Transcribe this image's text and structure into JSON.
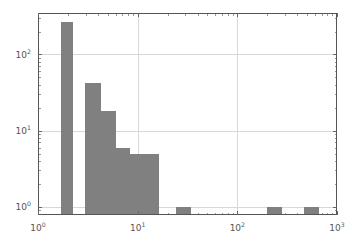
{
  "figure": {
    "background_color": "#ffffff",
    "plot_area": {
      "left": 38,
      "top": 13,
      "right": 337,
      "bottom": 215
    }
  },
  "chart_data": {
    "type": "bar",
    "subtype": "histogram-log-log",
    "title": "",
    "subtitle": "",
    "xlabel": "",
    "ylabel": "",
    "xscale": "log",
    "yscale": "log",
    "xlim": [
      1,
      1000
    ],
    "ylim": [
      0.78,
      350
    ],
    "grid": true,
    "grid_color": "#d8d8d8",
    "legend": null,
    "legend_position": "none",
    "bar_color": "#808080",
    "axis_color": "#555555",
    "x_tick_labels": [
      "10^0",
      "10^1",
      "10^2",
      "10^3"
    ],
    "x_tick_values": [
      1,
      10,
      100,
      1000
    ],
    "x_tick_display": [
      {
        "base": "10",
        "exp": "0"
      },
      {
        "base": "10",
        "exp": "1"
      },
      {
        "base": "10",
        "exp": "2"
      },
      {
        "base": "10",
        "exp": "3"
      }
    ],
    "y_tick_labels": [
      "10^0",
      "10^1",
      "10^2"
    ],
    "y_tick_values": [
      1,
      10,
      100
    ],
    "y_tick_display": [
      {
        "base": "10",
        "exp": "0"
      },
      {
        "base": "10",
        "exp": "1"
      },
      {
        "base": "10",
        "exp": "2"
      }
    ],
    "bins": [
      {
        "x_left": 1.69,
        "x_right": 2.26,
        "value": 270
      },
      {
        "x_left": 2.93,
        "x_right": 4.33,
        "value": 42
      },
      {
        "x_left": 4.33,
        "x_right": 6.03,
        "value": 18
      },
      {
        "x_left": 6.03,
        "x_right": 8.35,
        "value": 6
      },
      {
        "x_left": 8.35,
        "x_right": 16.5,
        "value": 5
      },
      {
        "x_left": 24.5,
        "x_right": 34.0,
        "value": 1
      },
      {
        "x_left": 200.0,
        "x_right": 280.0,
        "value": 1
      },
      {
        "x_left": 470.0,
        "x_right": 660.0,
        "value": 1
      }
    ],
    "categories": [
      "1.69-2.26",
      "2.93-4.33",
      "4.33-6.03",
      "6.03-8.35",
      "8.35-16.5",
      "24.5-34.0",
      "200-280",
      "470-660"
    ],
    "values": [
      270,
      42,
      18,
      6,
      5,
      1,
      1,
      1
    ]
  }
}
